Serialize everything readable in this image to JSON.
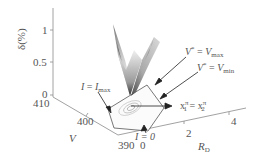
{
  "figure": {
    "type": "3d-surface",
    "z_axis": {
      "label": "δ(%)",
      "ticks": [
        "1",
        "0.5",
        "0"
      ]
    },
    "v_axis": {
      "label": "V",
      "ticks": [
        "410",
        "400",
        "390"
      ]
    },
    "rd_axis": {
      "label_main": "R",
      "label_sub": "D",
      "ticks": [
        "0",
        "2",
        "4"
      ]
    },
    "annotations": {
      "i_max": {
        "lhs": "I",
        "eq": " = ",
        "rhs": "I",
        "rhs_sub": "max"
      },
      "i_zero": {
        "text": "I = 0"
      },
      "v_max": {
        "lhs": "V",
        "lhs_sup": "*",
        "eq": " = ",
        "rhs": "V",
        "rhs_sub": "max"
      },
      "v_min": {
        "lhs": "V",
        "lhs_sup": "*",
        "eq": " = ",
        "rhs": "V",
        "rhs_sub": "min"
      },
      "x_eq": {
        "a": "x",
        "a_sub": "1",
        "a_sup": "π",
        "eq": " = ",
        "b": "x",
        "b_sub": "2",
        "b_sup": "π"
      }
    },
    "colors": {
      "axis": "#8a8a8a",
      "text": "#555555",
      "surface_dark": "#3a3a3a",
      "surface_light": "#e8e8e8"
    }
  }
}
